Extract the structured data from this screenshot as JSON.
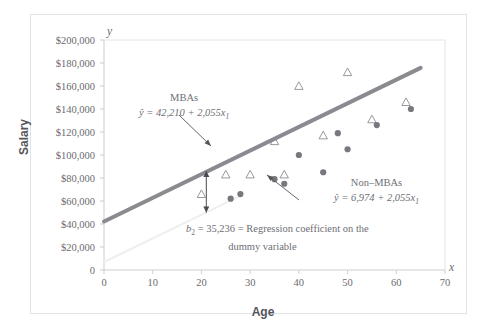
{
  "figure": {
    "title_remnant": "· · ·   · ·   · ·",
    "axis_x_symbol": "x",
    "axis_y_symbol": "y"
  },
  "annotations": {
    "mba_label": "MBAs",
    "mba_equation": "ŷ = 42,210 + 2,055x",
    "mba_equation_sub": "1",
    "nonmba_label": "Non–MBAs",
    "nonmba_equation": "ŷ = 6,974 + 2,055x",
    "nonmba_equation_sub": "1",
    "dummy_line1_pre": "b",
    "dummy_line1_sub": "2",
    "dummy_line1_post": " = 35,236 = Regression coefficient on the",
    "dummy_line2": "dummy variable"
  },
  "chart_data": {
    "type": "scatter",
    "title": "",
    "xlabel": "Age",
    "ylabel": "Salary",
    "xlim": [
      0,
      70
    ],
    "ylim": [
      0,
      200000
    ],
    "grid": false,
    "legend_position": "none",
    "xticks": [
      0,
      10,
      20,
      30,
      40,
      50,
      60,
      70
    ],
    "xtick_labels": [
      "0",
      "10",
      "20",
      "30",
      "40",
      "50",
      "60",
      "70"
    ],
    "yticks": [
      0,
      20000,
      40000,
      60000,
      80000,
      100000,
      120000,
      140000,
      160000,
      180000,
      200000
    ],
    "ytick_labels": [
      "0",
      "$20,000",
      "$40,000",
      "$60,000",
      "$80,000",
      "$100,000",
      "$120,000",
      "$140,000",
      "$160,000",
      "$180,000",
      "$200,000"
    ],
    "series": [
      {
        "name": "MBAs",
        "marker": "triangle-open",
        "color": "#8d8d93",
        "points": [
          {
            "x": 20,
            "y": 66000
          },
          {
            "x": 25,
            "y": 83000
          },
          {
            "x": 30,
            "y": 83000
          },
          {
            "x": 35,
            "y": 112000
          },
          {
            "x": 37,
            "y": 83000
          },
          {
            "x": 40,
            "y": 160000
          },
          {
            "x": 45,
            "y": 117000
          },
          {
            "x": 50,
            "y": 172000
          },
          {
            "x": 55,
            "y": 131000
          },
          {
            "x": 62,
            "y": 146000
          }
        ]
      },
      {
        "name": "Non-MBAs",
        "marker": "circle-filled",
        "color": "#77777e",
        "points": [
          {
            "x": 26,
            "y": 62000
          },
          {
            "x": 28,
            "y": 66000
          },
          {
            "x": 35,
            "y": 79000
          },
          {
            "x": 37,
            "y": 75000
          },
          {
            "x": 40,
            "y": 100000
          },
          {
            "x": 45,
            "y": 85000
          },
          {
            "x": 48,
            "y": 119000
          },
          {
            "x": 50,
            "y": 105000
          },
          {
            "x": 56,
            "y": 126000
          },
          {
            "x": 63,
            "y": 140000
          }
        ]
      }
    ],
    "lines": [
      {
        "name": "MBA regression line",
        "intercept": 42210,
        "slope": 2055,
        "color": "#8a8a90",
        "width": 4,
        "x_from": 0,
        "x_to": 65
      },
      {
        "name": "Non-MBA regression line",
        "intercept": 6974,
        "slope": 2055,
        "color": "#efefef",
        "width": 2,
        "x_from": 0,
        "x_to": 28
      }
    ],
    "gap_arrow": {
      "name": "dummy-coefficient-gap",
      "x": 21,
      "y_top": 86000,
      "y_bottom": 50000,
      "value": 35236
    }
  }
}
